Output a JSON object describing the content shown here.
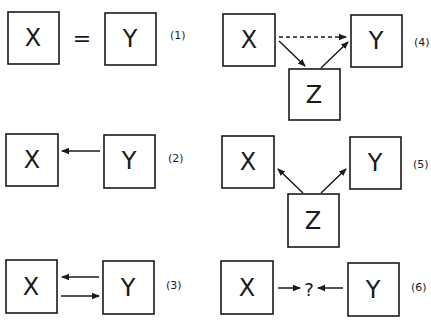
{
  "diagrams": [
    {
      "id": "1",
      "tag": "(1)",
      "nodes": {
        "x": "X",
        "y": "Y"
      },
      "relation": "="
    },
    {
      "id": "2",
      "tag": "(2)",
      "nodes": {
        "x": "X",
        "y": "Y"
      },
      "relation": "Y → X"
    },
    {
      "id": "3",
      "tag": "(3)",
      "nodes": {
        "x": "X",
        "y": "Y"
      },
      "relation": "X ⇄ Y"
    },
    {
      "id": "4",
      "tag": "(4)",
      "nodes": {
        "x": "X",
        "y": "Y",
        "z": "Z"
      },
      "relation": "X → Z → Y, X ⇢ Y (dashed)"
    },
    {
      "id": "5",
      "tag": "(5)",
      "nodes": {
        "x": "X",
        "y": "Y",
        "z": "Z"
      },
      "relation": "Z → X, Z → Y"
    },
    {
      "id": "6",
      "tag": "(6)",
      "nodes": {
        "x": "X",
        "y": "Y"
      },
      "relation": "X → ? ← Y",
      "unknown": "?"
    }
  ],
  "symbols": {
    "equals": "="
  }
}
